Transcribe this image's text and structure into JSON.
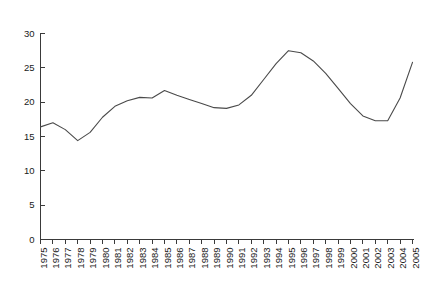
{
  "chart_data": {
    "type": "line",
    "title": "",
    "subtitle": "",
    "xlabel": "",
    "ylabel": "",
    "grid": false,
    "legend": false,
    "legend_position": "none",
    "line_color": "#4a4a4a",
    "axis_color": "#3a3a3a",
    "background_color": "#ffffff",
    "xlim": [
      1975,
      2005
    ],
    "ylim": [
      0,
      30
    ],
    "ytick_values": [
      0,
      5,
      10,
      15,
      20,
      25,
      30
    ],
    "ytick_labels": [
      "0",
      "5",
      "10",
      "15",
      "20",
      "25",
      "30"
    ],
    "xtick_orientation": "vertical",
    "categories": [
      "1975",
      "1976",
      "1977",
      "1978",
      "1979",
      "1980",
      "1981",
      "1982",
      "1983",
      "1984",
      "1985",
      "1986",
      "1987",
      "1988",
      "1989",
      "1990",
      "1991",
      "1992",
      "1993",
      "1994",
      "1995",
      "1996",
      "1997",
      "1998",
      "1999",
      "2000",
      "2001",
      "2002",
      "2003",
      "2004",
      "2005"
    ],
    "x": [
      1975,
      1976,
      1977,
      1978,
      1979,
      1980,
      1981,
      1982,
      1983,
      1984,
      1985,
      1986,
      1987,
      1988,
      1989,
      1990,
      1991,
      1992,
      1993,
      1994,
      1995,
      1996,
      1997,
      1998,
      1999,
      2000,
      2001,
      2002,
      2003,
      2004,
      2005
    ],
    "values": [
      16.4,
      17.0,
      16.0,
      14.4,
      15.6,
      17.8,
      19.4,
      20.2,
      20.7,
      20.6,
      21.7,
      21.0,
      20.4,
      19.8,
      19.2,
      19.1,
      19.6,
      21.0,
      23.3,
      25.6,
      27.5,
      27.2,
      26.0,
      24.2,
      22.0,
      19.8,
      18.0,
      17.3,
      17.3,
      20.6,
      25.8
    ],
    "series": [
      {
        "name": "series-1",
        "values": [
          16.4,
          17.0,
          16.0,
          14.4,
          15.6,
          17.8,
          19.4,
          20.2,
          20.7,
          20.6,
          21.7,
          21.0,
          20.4,
          19.8,
          19.2,
          19.1,
          19.6,
          21.0,
          23.3,
          25.6,
          27.5,
          27.2,
          26.0,
          24.2,
          22.0,
          19.8,
          18.0,
          17.3,
          17.3,
          20.6,
          25.8
        ]
      }
    ],
    "annotations": []
  }
}
